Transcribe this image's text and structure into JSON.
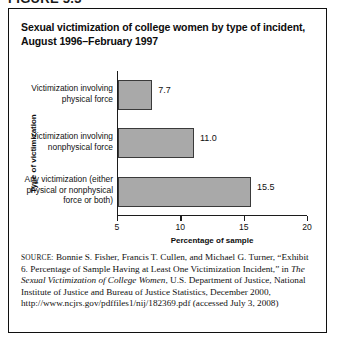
{
  "figure_label": "FIGURE 5.3",
  "title": {
    "line1": "Sexual victimization of college women by type of incident,",
    "line2": "August 1996–February 1997"
  },
  "chart_data": {
    "type": "bar",
    "orientation": "horizontal",
    "title": "Sexual victimization of college women by type of incident, August 1996–February 1997",
    "xlabel": "Percentage of sample",
    "ylabel": "Type of victimization",
    "xlim": [
      5,
      20
    ],
    "xticks": [
      "5",
      "10",
      "15",
      "20"
    ],
    "grid": false,
    "legend": "none",
    "bar_color": "#a9a9a9",
    "bar_border_color": "#3a3a3a",
    "categories": [
      "Victimization involving physical force",
      "Victimization involving nonphysical force",
      "Any victimization (either physical or nonphysical force or both)"
    ],
    "category_lines": [
      [
        "Victimization involving",
        "physical force"
      ],
      [
        "Victimization involving",
        "nonphysical force"
      ],
      [
        "Any victimization (either",
        "physical or nonphysical",
        "force or both)"
      ]
    ],
    "values": [
      7.7,
      11.0,
      15.5
    ],
    "value_labels": [
      "7.7",
      "11.0",
      "15.5"
    ]
  },
  "source": {
    "label": "source:",
    "text": " Bonnie S. Fisher, Francis T. Cullen, and Michael G. Turner, “Exhibit 6. Percentage of Sample Having at Least One Victimization Incident,” in ",
    "italic_title": "The Sexual Victimization of College Women",
    "text_after": ", U.S. Department of Justice, National Institute of Justice and Bureau of Justice Statistics, December 2000, http://www.ncjrs.gov/pdffiles1/nij/182369.pdf (accessed July 3, 2008)"
  }
}
